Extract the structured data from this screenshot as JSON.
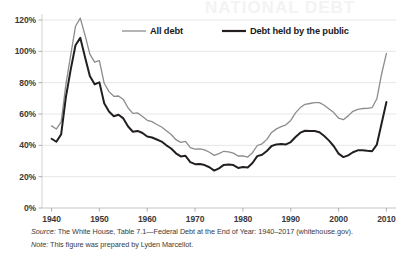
{
  "figure": {
    "watermark_text": "NATIONAL DEBT"
  },
  "legend": {
    "position": "top-center",
    "entries": [
      {
        "label": "All debt",
        "color": "#8c8c8c",
        "width": 1.3
      },
      {
        "label": "Debt held by the public",
        "color": "#231f20",
        "width": 2.0
      }
    ]
  },
  "caption": {
    "source_lead": "Source:",
    "source_text": " The White House, Table 7.1—Federal Debt at the End of Year: 1940–2017 (whitehouse.gov).",
    "note_lead": "Note:",
    "note_text": " This figure was prepared by Lyden Marcellot."
  },
  "chart_data": {
    "type": "line",
    "title": "",
    "xlabel": "",
    "ylabel": "",
    "xlim": [
      1938,
      2012
    ],
    "ylim": [
      0,
      120
    ],
    "grid": true,
    "y_ticks": [
      0,
      20,
      40,
      60,
      80,
      100,
      120
    ],
    "y_tick_labels": [
      "0%",
      "20%",
      "40%",
      "60%",
      "80%",
      "100%",
      "120%"
    ],
    "x_ticks": [
      1940,
      1950,
      1960,
      1970,
      1980,
      1990,
      2000,
      2010
    ],
    "x_tick_labels": [
      "1940",
      "1950",
      "1960",
      "1970",
      "1980",
      "1990",
      "2000",
      "2010"
    ],
    "x": [
      1940,
      1941,
      1942,
      1943,
      1944,
      1945,
      1946,
      1947,
      1948,
      1949,
      1950,
      1951,
      1952,
      1953,
      1954,
      1955,
      1956,
      1957,
      1958,
      1959,
      1960,
      1961,
      1962,
      1963,
      1964,
      1965,
      1966,
      1967,
      1968,
      1969,
      1970,
      1971,
      1972,
      1973,
      1974,
      1975,
      1976,
      1977,
      1978,
      1979,
      1980,
      1981,
      1982,
      1983,
      1984,
      1985,
      1986,
      1987,
      1988,
      1989,
      1990,
      1991,
      1992,
      1993,
      1994,
      1995,
      1996,
      1997,
      1998,
      1999,
      2000,
      2001,
      2002,
      2003,
      2004,
      2005,
      2006,
      2007,
      2008,
      2009,
      2010
    ],
    "series": [
      {
        "name": "All debt",
        "color": "#8c8c8c",
        "values": [
          52.4,
          50.4,
          54.9,
          79.1,
          97.6,
          116.0,
          121.2,
          110.3,
          98.2,
          93.1,
          94.0,
          79.6,
          74.3,
          71.3,
          71.5,
          69.3,
          63.8,
          60.4,
          60.7,
          58.4,
          56.0,
          55.1,
          53.3,
          51.7,
          49.3,
          46.9,
          43.6,
          41.9,
          42.5,
          38.6,
          37.6,
          37.8,
          37.1,
          35.6,
          33.6,
          34.7,
          36.2,
          35.8,
          35.0,
          33.2,
          33.3,
          32.5,
          35.3,
          39.9,
          41.0,
          43.8,
          48.2,
          50.5,
          51.9,
          53.1,
          55.9,
          60.7,
          64.1,
          66.2,
          66.7,
          67.2,
          67.3,
          65.6,
          63.2,
          60.9,
          57.3,
          56.4,
          58.8,
          61.7,
          62.9,
          63.5,
          63.6,
          64.0,
          69.7,
          85.7,
          98.7
        ]
      },
      {
        "name": "Debt held by the public",
        "color": "#231f20",
        "values": [
          44.2,
          42.3,
          47.0,
          70.9,
          88.3,
          103.9,
          108.6,
          96.2,
          84.3,
          79.0,
          80.2,
          66.9,
          61.6,
          58.6,
          59.5,
          57.2,
          52.0,
          48.7,
          49.2,
          47.9,
          45.6,
          45.0,
          43.7,
          42.4,
          40.0,
          38.0,
          34.9,
          32.9,
          33.3,
          29.3,
          28.0,
          28.1,
          27.4,
          26.0,
          23.9,
          25.3,
          27.5,
          27.8,
          27.4,
          25.6,
          26.1,
          25.8,
          28.7,
          33.1,
          34.0,
          36.4,
          39.6,
          40.6,
          40.9,
          40.6,
          42.1,
          45.3,
          48.1,
          49.3,
          49.2,
          49.1,
          48.4,
          45.9,
          43.0,
          39.4,
          34.7,
          32.5,
          33.6,
          35.6,
          36.8,
          36.9,
          36.5,
          36.2,
          40.5,
          54.1,
          67.7
        ]
      }
    ]
  }
}
